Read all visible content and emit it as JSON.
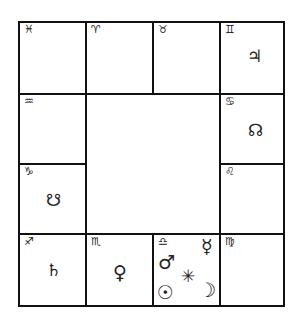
{
  "chart": {
    "type": "South Indian rasi chart",
    "houses": [
      {
        "id": "pisces",
        "sign_glyph": "♓",
        "planets": []
      },
      {
        "id": "aries",
        "sign_glyph": "♈",
        "planets": []
      },
      {
        "id": "taurus",
        "sign_glyph": "♉",
        "planets": []
      },
      {
        "id": "gemini",
        "sign_glyph": "♊",
        "planets": [
          {
            "name": "jupiter",
            "glyph": "♃"
          }
        ]
      },
      {
        "id": "aquarius",
        "sign_glyph": "♒",
        "planets": []
      },
      {
        "id": "cancer",
        "sign_glyph": "♋",
        "planets": [
          {
            "name": "rahu",
            "glyph": "☊"
          }
        ]
      },
      {
        "id": "capricorn",
        "sign_glyph": "♑",
        "planets": [
          {
            "name": "ketu",
            "glyph": "☋"
          }
        ]
      },
      {
        "id": "leo",
        "sign_glyph": "♌",
        "planets": []
      },
      {
        "id": "sagittarius",
        "sign_glyph": "♐",
        "planets": [
          {
            "name": "saturn",
            "glyph": "♄"
          }
        ]
      },
      {
        "id": "scorpio",
        "sign_glyph": "♏",
        "planets": [
          {
            "name": "venus",
            "glyph": "♀"
          }
        ]
      },
      {
        "id": "libra",
        "sign_glyph": "♎",
        "planets": [
          {
            "name": "mercury",
            "glyph": "☿"
          },
          {
            "name": "mars",
            "glyph": "♂"
          },
          {
            "name": "ascendant",
            "glyph": "✳"
          },
          {
            "name": "sun",
            "glyph": "☉"
          },
          {
            "name": "moon",
            "glyph": "☽"
          }
        ]
      },
      {
        "id": "virgo",
        "sign_glyph": "♍",
        "planets": []
      }
    ]
  }
}
